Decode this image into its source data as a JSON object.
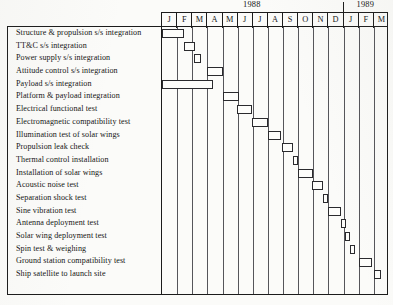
{
  "chart_data": {
    "type": "bar",
    "subtype": "gantt",
    "title": "",
    "xlabel": "",
    "ylabel": "",
    "grid": true,
    "legend": false,
    "axis": {
      "months": [
        "J",
        "F",
        "M",
        "A",
        "M",
        "J",
        "J",
        "A",
        "S",
        "O",
        "N",
        "D",
        "J",
        "F",
        "M"
      ],
      "years": [
        {
          "label": "1988",
          "start_index": 0,
          "span": 12
        },
        {
          "label": "1989",
          "start_index": 12,
          "span": 3
        }
      ],
      "column_count": 15,
      "year_divider_after_index": 11
    },
    "categories": [
      "Structure & propulsion s/s integration",
      "TT&C s/s integration",
      "Power supply s/s integration",
      "Attitude control s/s integration",
      "Payload s/s integration",
      "Platform & payload integration",
      "Electrical functional test",
      "Electromagnetic compatibility test",
      "Illumination test of solar wings",
      "Propulsion leak check",
      "Thermal control installation",
      "Installation of solar wings",
      "Acoustic noise test",
      "Separation shock test",
      "Sine vibration test",
      "Antenna deployment test",
      "Solar wing deployment test",
      "Spin test & weighing",
      "Ground station compatibility test",
      "Ship satellite to launch site"
    ],
    "tasks": [
      {
        "name": "Structure & propulsion s/s integration",
        "start": 0.0,
        "end": 1.45
      },
      {
        "name": "TT&C s/s integration",
        "start": 1.45,
        "end": 2.15
      },
      {
        "name": "Power supply s/s integration",
        "start": 2.1,
        "end": 2.6
      },
      {
        "name": "Attitude control s/s integration",
        "start": 2.95,
        "end": 4.0
      },
      {
        "name": "Payload s/s integration",
        "start": 0.0,
        "end": 3.4
      },
      {
        "name": "Platform & payload integration",
        "start": 4.0,
        "end": 5.1
      },
      {
        "name": "Electrical functional test",
        "start": 4.95,
        "end": 5.95
      },
      {
        "name": "Electromagnetic compatibility test",
        "start": 5.95,
        "end": 7.0
      },
      {
        "name": "Illumination test of solar wings",
        "start": 7.0,
        "end": 7.85
      },
      {
        "name": "Propulsion leak check",
        "start": 7.9,
        "end": 8.65
      },
      {
        "name": "Thermal control installation",
        "start": 8.65,
        "end": 9.0
      },
      {
        "name": "Installation of solar wings",
        "start": 9.0,
        "end": 9.95
      },
      {
        "name": "Acoustic noise test",
        "start": 9.9,
        "end": 10.65
      },
      {
        "name": "Separation shock test",
        "start": 10.65,
        "end": 11.0
      },
      {
        "name": "Sine vibration test",
        "start": 11.0,
        "end": 11.8
      },
      {
        "name": "Antenna deployment test",
        "start": 11.8,
        "end": 12.15
      },
      {
        "name": "Solar wing deployment test",
        "start": 12.1,
        "end": 12.4
      },
      {
        "name": "Spin test & weighing",
        "start": 12.4,
        "end": 12.75
      },
      {
        "name": "Ground station compatibility test",
        "start": 13.0,
        "end": 13.9
      },
      {
        "name": "Ship satellite to launch site",
        "start": 14.0,
        "end": 14.5
      }
    ],
    "bar_style": {
      "fill": "#fdfdfb",
      "stroke": "#2a2a2e"
    }
  }
}
